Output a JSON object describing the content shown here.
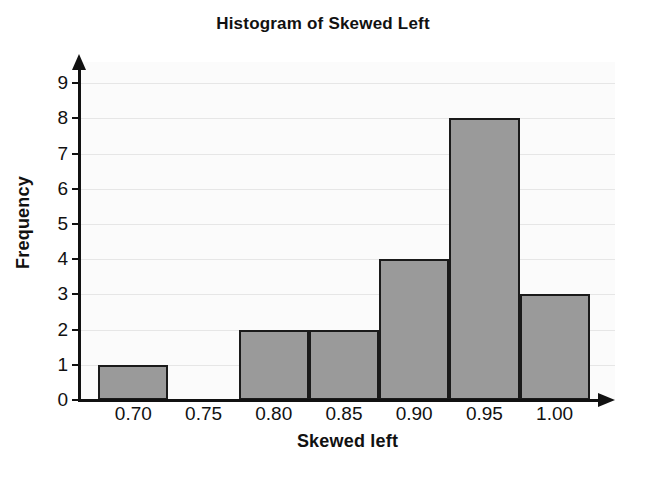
{
  "chart_data": {
    "type": "bar",
    "title": "Histogram of Skewed Left",
    "xlabel": "Skewed left",
    "ylabel": "Frequency",
    "bin_width": 0.05,
    "bin_edges": [
      0.675,
      0.725,
      0.775,
      0.825,
      0.875,
      0.925,
      0.975,
      1.025
    ],
    "bin_centers": [
      0.7,
      0.75,
      0.8,
      0.85,
      0.9,
      0.95,
      1.0
    ],
    "categories": [
      "0.70",
      "0.75",
      "0.80",
      "0.85",
      "0.90",
      "0.95",
      "1.00"
    ],
    "values": [
      1,
      0,
      2,
      2,
      4,
      8,
      3
    ],
    "xtick_labels": [
      "0.70",
      "0.75",
      "0.80",
      "0.85",
      "0.90",
      "0.95",
      "1.00"
    ],
    "ytick_labels": [
      "0",
      "1",
      "2",
      "3",
      "4",
      "5",
      "6",
      "7",
      "8",
      "9"
    ],
    "ylim": [
      0,
      9.6
    ],
    "xlim": [
      0.662,
      1.043
    ],
    "grid": "horizontal",
    "legend": "none",
    "bar_fill_color": "#9a9a9a",
    "bar_edge_color": "#1a1a1a",
    "axis_color": "#111111",
    "gridline_color": "#e6e6e6",
    "plot_background": "#fbfbfb",
    "figure_background": "#ffffff",
    "x_axis_has_arrow": true,
    "y_axis_has_arrow": true
  }
}
